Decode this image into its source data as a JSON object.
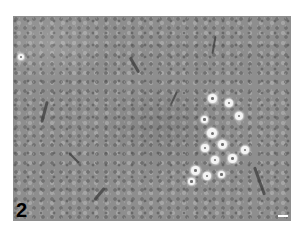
{
  "figure": {
    "panel_label": "2",
    "scale_bar": {
      "color": "#ffffff"
    }
  },
  "colors": {
    "background": "#ffffff",
    "tissue_gray": "#8e8e8e",
    "vacuole": "#f4f4f4"
  }
}
